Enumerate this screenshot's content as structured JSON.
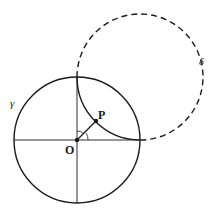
{
  "diagram": {
    "labels": {
      "gamma": "γ",
      "delta": "δ",
      "origin": "O",
      "point": "P"
    },
    "colors": {
      "stroke": "#1a1a1a",
      "background": "#ffffff"
    },
    "circle_gamma": {
      "cx": 77,
      "cy": 140,
      "r": 63,
      "style": "solid"
    },
    "circle_delta": {
      "cx": 140,
      "cy": 77,
      "r": 63,
      "style": "dashed outside γ, solid arc inside γ"
    },
    "axes": "horizontal and vertical diameters of γ through O",
    "segment": "O to P with angle arcs at O"
  }
}
